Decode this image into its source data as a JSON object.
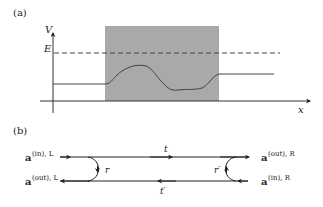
{
  "panel_a": {
    "label": "(a)",
    "y_axis_label": "V",
    "x_axis_label": "x",
    "energy_label": "E",
    "colors": {
      "barrier_fill": "#a8a8a8",
      "line": "#333333",
      "dashed": "#444444"
    }
  },
  "panel_b": {
    "label": "(b)",
    "left_in": {
      "base": "a",
      "sup": "(in), L"
    },
    "left_out": {
      "base": "a",
      "sup": "(out), L"
    },
    "right_out": {
      "base": "a",
      "sup": "(out), R"
    },
    "right_in": {
      "base": "a",
      "sup": "(in), R"
    },
    "transmission_top": "t",
    "transmission_bottom": "t′",
    "reflection_left": "r",
    "reflection_right": "r′"
  }
}
